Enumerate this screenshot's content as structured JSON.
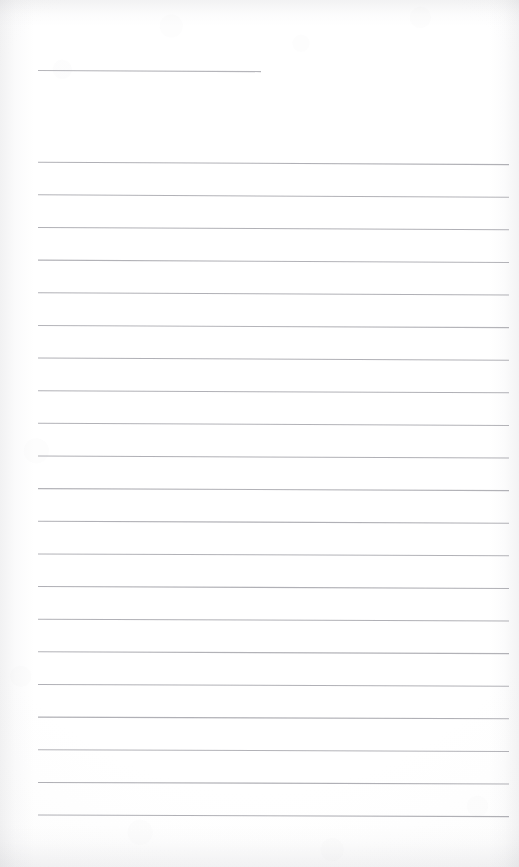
{
  "document": {
    "kind": "scanned-lined-notebook-page",
    "page_label": "",
    "handwriting_present": "none",
    "content_text": "",
    "canvas": {
      "width": 519,
      "height": 867
    }
  },
  "colors": {
    "paper": "#ffffff",
    "rule_line": "#a6a6ac",
    "rule_line_light": "#c2c2c8",
    "scan_edge_shadow": "#b4b4ba"
  },
  "header_rule": {
    "name": "title-rule",
    "x1": 38,
    "y1": 70.5,
    "x2": 261,
    "y2": 71.6,
    "stroke_width": 1.1,
    "opacity": 0.82
  },
  "body_rules": [
    {
      "index": 1,
      "x1": 38,
      "y1": 162.2,
      "x2": 509,
      "y2": 164.6,
      "stroke_width": 1.05,
      "opacity": 0.88
    },
    {
      "index": 2,
      "x1": 38,
      "y1": 194.8,
      "x2": 509,
      "y2": 197.2,
      "stroke_width": 1.05,
      "opacity": 0.86
    },
    {
      "index": 3,
      "x1": 38,
      "y1": 227.5,
      "x2": 509,
      "y2": 229.8,
      "stroke_width": 1.05,
      "opacity": 0.88
    },
    {
      "index": 4,
      "x1": 38,
      "y1": 260.1,
      "x2": 509,
      "y2": 262.4,
      "stroke_width": 1.05,
      "opacity": 0.86
    },
    {
      "index": 5,
      "x1": 38,
      "y1": 292.8,
      "x2": 509,
      "y2": 295.0,
      "stroke_width": 1.05,
      "opacity": 0.88
    },
    {
      "index": 6,
      "x1": 38,
      "y1": 325.4,
      "x2": 509,
      "y2": 327.6,
      "stroke_width": 1.05,
      "opacity": 0.84
    },
    {
      "index": 7,
      "x1": 38,
      "y1": 358.0,
      "x2": 509,
      "y2": 360.2,
      "stroke_width": 1.05,
      "opacity": 0.88
    },
    {
      "index": 8,
      "x1": 38,
      "y1": 390.7,
      "x2": 509,
      "y2": 392.8,
      "stroke_width": 1.05,
      "opacity": 0.88
    },
    {
      "index": 9,
      "x1": 38,
      "y1": 423.3,
      "x2": 509,
      "y2": 425.4,
      "stroke_width": 1.05,
      "opacity": 0.86
    },
    {
      "index": 10,
      "x1": 38,
      "y1": 456.0,
      "x2": 509,
      "y2": 458.0,
      "stroke_width": 1.05,
      "opacity": 0.88
    },
    {
      "index": 11,
      "x1": 38,
      "y1": 488.6,
      "x2": 509,
      "y2": 490.6,
      "stroke_width": 1.05,
      "opacity": 0.86
    },
    {
      "index": 12,
      "x1": 38,
      "y1": 521.2,
      "x2": 509,
      "y2": 523.2,
      "stroke_width": 1.05,
      "opacity": 0.88
    },
    {
      "index": 13,
      "x1": 38,
      "y1": 553.9,
      "x2": 509,
      "y2": 555.8,
      "stroke_width": 1.05,
      "opacity": 0.86
    },
    {
      "index": 14,
      "x1": 38,
      "y1": 586.5,
      "x2": 509,
      "y2": 588.4,
      "stroke_width": 1.05,
      "opacity": 0.88
    },
    {
      "index": 15,
      "x1": 38,
      "y1": 619.2,
      "x2": 509,
      "y2": 621.0,
      "stroke_width": 1.05,
      "opacity": 0.88
    },
    {
      "index": 16,
      "x1": 38,
      "y1": 651.8,
      "x2": 509,
      "y2": 653.6,
      "stroke_width": 1.05,
      "opacity": 0.86
    },
    {
      "index": 17,
      "x1": 38,
      "y1": 684.4,
      "x2": 509,
      "y2": 686.2,
      "stroke_width": 1.05,
      "opacity": 0.88
    },
    {
      "index": 18,
      "x1": 38,
      "y1": 717.1,
      "x2": 509,
      "y2": 718.8,
      "stroke_width": 1.05,
      "opacity": 0.88
    },
    {
      "index": 19,
      "x1": 38,
      "y1": 749.7,
      "x2": 509,
      "y2": 751.4,
      "stroke_width": 1.05,
      "opacity": 0.86
    },
    {
      "index": 20,
      "x1": 38,
      "y1": 782.4,
      "x2": 509,
      "y2": 784.0,
      "stroke_width": 1.05,
      "opacity": 0.88
    },
    {
      "index": 21,
      "x1": 38,
      "y1": 815.0,
      "x2": 509,
      "y2": 816.6,
      "stroke_width": 1.05,
      "opacity": 0.88
    }
  ],
  "metrics": {
    "rule_count": 21,
    "rule_spacing_px": 32.65,
    "left_margin_px": 38,
    "right_margin_px": 10
  }
}
